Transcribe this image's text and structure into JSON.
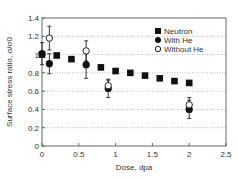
{
  "chart_data": {
    "type": "scatter",
    "title": "",
    "xlabel": "Dose, dpa",
    "ylabel": "Surface stress ratio, σ/σ0",
    "xlim": [
      0,
      2.5
    ],
    "ylim": [
      0,
      1.4
    ],
    "xticks": [
      "0",
      "0.5",
      "1",
      "1.5",
      "2",
      "2.5"
    ],
    "yticks": [
      "0",
      "0.2",
      "0.4",
      "0.6",
      "0.8",
      "1",
      "1.2",
      "1.4"
    ],
    "grid": "horizontal dotted",
    "legend_position": "upper right",
    "series": [
      {
        "name": "Neutron",
        "marker": "filled-square",
        "points": [
          {
            "x": 0.0,
            "y": 1.0
          },
          {
            "x": 0.2,
            "y": 0.99
          },
          {
            "x": 0.4,
            "y": 0.95
          },
          {
            "x": 0.8,
            "y": 0.86
          },
          {
            "x": 1.0,
            "y": 0.82
          },
          {
            "x": 1.2,
            "y": 0.8
          },
          {
            "x": 1.4,
            "y": 0.77
          },
          {
            "x": 1.6,
            "y": 0.74
          },
          {
            "x": 1.8,
            "y": 0.71
          },
          {
            "x": 2.0,
            "y": 0.69
          }
        ]
      },
      {
        "name": "With He",
        "marker": "filled-circle",
        "points": [
          {
            "x": 0.0,
            "y": 1.01,
            "err": 0.12
          },
          {
            "x": 0.1,
            "y": 0.9,
            "err": 0.11
          },
          {
            "x": 0.6,
            "y": 0.89,
            "err": 0.15
          },
          {
            "x": 0.9,
            "y": 0.63,
            "err": 0.1
          },
          {
            "x": 2.0,
            "y": 0.4,
            "err": 0.1
          }
        ]
      },
      {
        "name": "Without He",
        "marker": "open-circle",
        "points": [
          {
            "x": 0.1,
            "y": 1.18,
            "err": 0.13
          },
          {
            "x": 0.6,
            "y": 1.04,
            "err": 0.11
          },
          {
            "x": 0.9,
            "y": 0.66,
            "err": 0.06
          },
          {
            "x": 2.0,
            "y": 0.45,
            "err": 0.08
          }
        ]
      }
    ]
  },
  "legend": {
    "items": [
      {
        "label": "Neutron",
        "marker": "filled-square"
      },
      {
        "label": "With He",
        "marker": "filled-circle"
      },
      {
        "label": "Without He",
        "marker": "open-circle"
      }
    ]
  },
  "axes": {
    "xlabel": "Dose, dpa",
    "ylabel": "Surface stress ratio, σ/σ0"
  }
}
